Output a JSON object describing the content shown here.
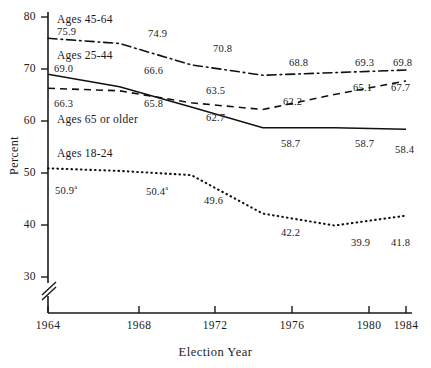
{
  "chart_data": {
    "type": "line",
    "title": "",
    "xlabel": "Election Year",
    "ylabel": "Percent",
    "x": [
      1964,
      1968,
      1972,
      1976,
      1980,
      1984
    ],
    "xlim": [
      1964,
      1984
    ],
    "ylim": [
      30,
      80
    ],
    "yticks": [
      30,
      40,
      50,
      60,
      70,
      80
    ],
    "xticks": [
      "1964",
      "1968",
      "1972",
      "1976",
      "1980",
      "1984"
    ],
    "ytick_labels": [
      "30",
      "40",
      "50",
      "60",
      "70",
      "80"
    ],
    "grid": false,
    "axis_break": true,
    "legend_position": "inline-annotations",
    "series": [
      {
        "name": "Ages 45-64",
        "style": "dash-dot",
        "values": [
          75.9,
          74.9,
          70.8,
          68.8,
          69.3,
          69.8
        ],
        "point_labels": [
          "75.9",
          "74.9",
          "70.8",
          "68.8",
          "69.3",
          "69.8"
        ]
      },
      {
        "name": "Ages 25-44",
        "style": "solid",
        "values": [
          69.0,
          66.6,
          62.7,
          58.7,
          58.7,
          58.4
        ],
        "point_labels": [
          "69.0",
          "66.6",
          "62.7",
          "58.7",
          "58.7",
          "58.4"
        ]
      },
      {
        "name": "Ages 65 or older",
        "style": "dashed",
        "values": [
          66.3,
          65.8,
          63.5,
          62.2,
          65.1,
          67.7
        ],
        "point_labels": [
          "66.3",
          "65.8",
          "63.5",
          "62.2",
          "65.1",
          "67.7"
        ]
      },
      {
        "name": "Ages 18-24",
        "style": "dotted",
        "values": [
          50.9,
          50.4,
          49.6,
          42.2,
          39.9,
          41.8
        ],
        "point_labels": [
          "50.9",
          "50.4",
          "49.6",
          "42.2",
          "39.9",
          "41.8"
        ],
        "footnote_marker": "a",
        "footnote_points": [
          0,
          1
        ]
      }
    ],
    "annotations": [
      {
        "text": "Ages 45-64",
        "x": 1964,
        "y": 79.2
      },
      {
        "text": "Ages 25-44",
        "x": 1964,
        "y": 72.3
      },
      {
        "text": "Ages 65 or older",
        "x": 1964,
        "y": 60.1
      },
      {
        "text": "Ages 18-24",
        "x": 1964,
        "y": 54.0
      }
    ]
  },
  "labels": {
    "y_axis_title": "Percent",
    "x_axis_title": "Election Year",
    "yticks": [
      "80",
      "70",
      "60",
      "50",
      "40",
      "30"
    ],
    "xticks": [
      "1964",
      "1968",
      "1972",
      "1976",
      "1980",
      "1984"
    ],
    "series_names": {
      "s0": "Ages 45-64",
      "s1": "Ages 25-44",
      "s2": "Ages 65 or older",
      "s3": "Ages 18-24"
    },
    "points": {
      "dashdot": [
        "75.9",
        "74.9",
        "70.8",
        "68.8",
        "69.3",
        "69.8"
      ],
      "solid": [
        "69.0",
        "66.6",
        "62.7",
        "58.7",
        "58.7",
        "58.4"
      ],
      "dashed": [
        "66.3",
        "65.8",
        "63.5",
        "62.2",
        "65.1",
        "67.7"
      ],
      "dotted": [
        "50.9",
        "50.4",
        "49.6",
        "42.2",
        "39.9",
        "41.8"
      ]
    },
    "footnote_marker": "a"
  },
  "colors": {
    "ink": "#1a1a1a",
    "background": "#ffffff"
  }
}
